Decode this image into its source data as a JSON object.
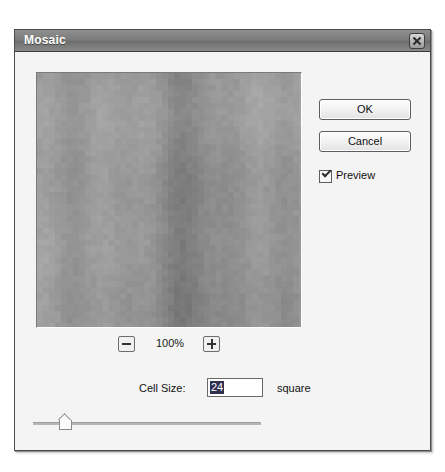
{
  "dialog": {
    "title": "Mosaic",
    "close_icon": "close-x-icon"
  },
  "buttons": {
    "ok": "OK",
    "cancel": "Cancel"
  },
  "preview": {
    "label": "Preview",
    "checked": true,
    "checkbox_icon": "checkmark-icon"
  },
  "zoom": {
    "level": "100%",
    "out_icon": "minus-icon",
    "in_icon": "plus-icon"
  },
  "cell_size": {
    "label": "Cell Size:",
    "value": "24",
    "unit": "square",
    "selected": true
  },
  "slider": {
    "position_percent": 12
  },
  "colors": {
    "titlebar": "#7b7b7b",
    "dialog_face": "#f4f4f4",
    "selection": "#2f2f4f",
    "border": "#5d5d5d"
  },
  "preview_image": {
    "description": "mosaic-filtered gray image",
    "base_gray": "#9a9a9a"
  }
}
